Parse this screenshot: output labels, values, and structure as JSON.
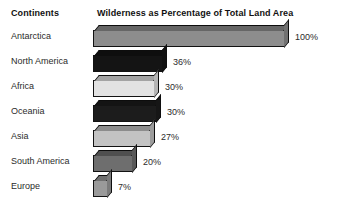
{
  "header": {
    "continents_label": "Continents",
    "title": "Wilderness as Percentage of Total Land Area"
  },
  "chart_data": {
    "type": "bar",
    "orientation": "horizontal",
    "title": "Wilderness as Percentage of Total Land Area",
    "xlabel": "",
    "ylabel": "Continents",
    "xlim": [
      0,
      100
    ],
    "grid": false,
    "legend": false,
    "style": "3d-isometric-bars",
    "categories": [
      "Antarctica",
      "North America",
      "Africa",
      "Oceania",
      "Asia",
      "South America",
      "Europe"
    ],
    "values": [
      100,
      36,
      30,
      30,
      27,
      20,
      7
    ],
    "value_labels": [
      "100%",
      "36%",
      "30%",
      "30%",
      "27%",
      "20%",
      "7%"
    ],
    "bars": [
      {
        "category": "Antarctica",
        "value": 100,
        "label": "100%",
        "color": "#8d8d8d",
        "pixel_width": 192
      },
      {
        "category": "North America",
        "value": 36,
        "label": "36%",
        "color": "#141414",
        "pixel_width": 70
      },
      {
        "category": "Africa",
        "value": 30,
        "label": "30%",
        "color": "#e2e2e2",
        "pixel_width": 62
      },
      {
        "category": "Oceania",
        "value": 30,
        "label": "30%",
        "color": "#1c1c1c",
        "pixel_width": 64
      },
      {
        "category": "Asia",
        "value": 27,
        "label": "27%",
        "color": "#c3c3c3",
        "pixel_width": 58
      },
      {
        "category": "South America",
        "value": 20,
        "label": "20%",
        "color": "#6e6e6e",
        "pixel_width": 40
      },
      {
        "category": "Europe",
        "value": 7,
        "label": "7%",
        "color": "#9a9a9a",
        "pixel_width": 15
      }
    ]
  }
}
